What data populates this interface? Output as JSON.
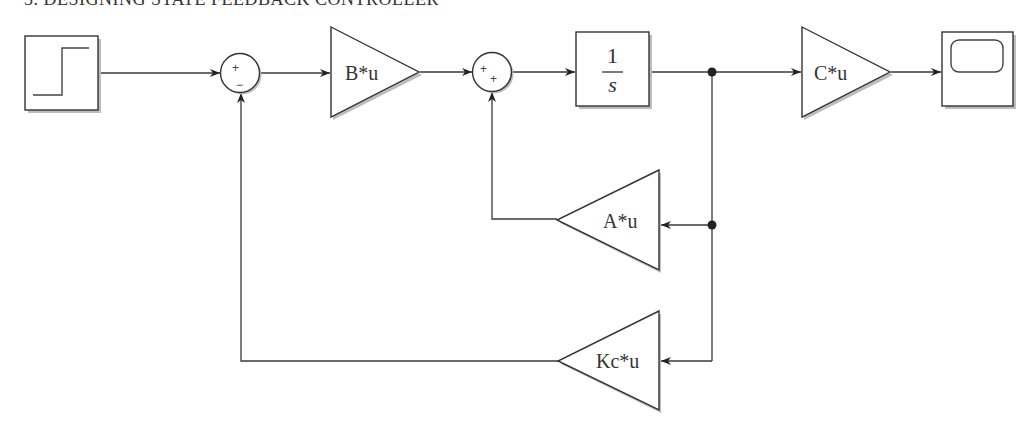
{
  "title": "3. DESIGNING STATE FEEDBACK CONTROLLER",
  "blocks": {
    "step": {
      "type": "Step",
      "label": ""
    },
    "sum1": {
      "type": "Sum",
      "signs": [
        "+",
        "−"
      ]
    },
    "gain_b": {
      "type": "Gain",
      "label": "B*u"
    },
    "sum2": {
      "type": "Sum",
      "signs": [
        "+",
        "+"
      ]
    },
    "integrator": {
      "type": "Integrator",
      "numerator": "1",
      "denominator": "s"
    },
    "gain_c": {
      "type": "Gain",
      "label": "C*u"
    },
    "scope": {
      "type": "Scope",
      "label": ""
    },
    "gain_a": {
      "type": "Gain",
      "label": "A*u"
    },
    "gain_kc": {
      "type": "Gain",
      "label": "Kc*u"
    }
  },
  "connections": [
    {
      "from": "step",
      "to": "sum1",
      "port": "+"
    },
    {
      "from": "sum1",
      "to": "gain_b"
    },
    {
      "from": "gain_b",
      "to": "sum2",
      "port": "+"
    },
    {
      "from": "sum2",
      "to": "integrator"
    },
    {
      "from": "integrator",
      "to": "gain_c"
    },
    {
      "from": "gain_c",
      "to": "scope"
    },
    {
      "from": "integrator",
      "to": "gain_a"
    },
    {
      "from": "gain_a",
      "to": "sum2",
      "port": "+"
    },
    {
      "from": "integrator",
      "to": "gain_kc"
    },
    {
      "from": "gain_kc",
      "to": "sum1",
      "port": "−"
    }
  ]
}
